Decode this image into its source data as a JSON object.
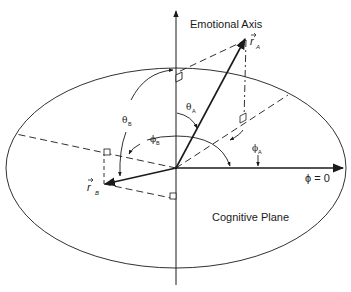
{
  "diagram": {
    "title": "",
    "labels": {
      "emotional_axis": "Emotional Axis",
      "cognitive_plane": "Cognitive Plane",
      "phi_zero": "ϕ = 0",
      "r_a": "r",
      "r_a_sub": "A",
      "r_b": "r",
      "r_b_sub": "B",
      "theta_a": "θ",
      "theta_a_sub": "A",
      "theta_b": "θ",
      "theta_b_sub": "B",
      "phi_a": "ϕ",
      "phi_a_sub": "A",
      "phi_b": "ϕ",
      "phi_b_sub": "B"
    },
    "elements": {
      "vertical_axis": "Emotional Axis (vertical, arrow up)",
      "ellipse": "Cognitive Plane (horizontal ellipse)",
      "vector_a": "r_A pointing up-right above plane",
      "vector_b": "r_B pointing left-down below plane",
      "reference_axis": "phi = 0 direction, arrow right"
    },
    "colors": {
      "ink": "#1a1a1a",
      "background": "#ffffff"
    }
  }
}
